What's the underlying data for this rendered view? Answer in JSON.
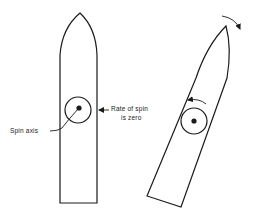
{
  "diagram": {
    "labels": {
      "spin_axis": "Spin axis",
      "rate_line1": "Rate of spin",
      "rate_line2": "is zero"
    },
    "colors": {
      "stroke": "#1a1a1a",
      "background": "#ffffff"
    },
    "figures": [
      {
        "name": "upright-rocket",
        "description": "Rocket standing vertically with gyroscope at center, rate of spin is zero"
      },
      {
        "name": "tilted-rocket",
        "description": "Rocket tilting clockwise, gyroscope precessing counter-clockwise"
      }
    ]
  }
}
